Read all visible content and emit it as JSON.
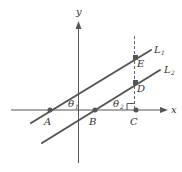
{
  "diagram": {
    "axes": {
      "x_label": "x",
      "y_label": "y"
    },
    "lines": [
      {
        "id": "L1",
        "label": "L",
        "subscript": "1"
      },
      {
        "id": "L2",
        "label": "L",
        "subscript": "2"
      }
    ],
    "points": {
      "A": "A",
      "B": "B",
      "C": "C",
      "D": "D",
      "E": "E"
    },
    "angles": {
      "theta1": {
        "symbol": "θ",
        "subscript": "1"
      },
      "theta2": {
        "symbol": "θ",
        "subscript": "2"
      }
    },
    "colors": {
      "stroke": "#555555",
      "text": "#333333",
      "background": "#ffffff"
    }
  }
}
